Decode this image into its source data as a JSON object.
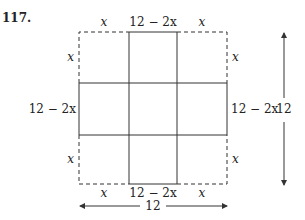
{
  "problem_number": "117.",
  "labels": {
    "top": [
      "x",
      "12 − 2x",
      "x"
    ],
    "bottom": [
      "x",
      "12 − 2x",
      "x"
    ],
    "left": [
      "x",
      "12 − 2x",
      "x"
    ],
    "right": [
      "x",
      "12 − 2x",
      "x"
    ],
    "total_width": "12",
    "total_height": "12",
    "variable": "x"
  }
}
